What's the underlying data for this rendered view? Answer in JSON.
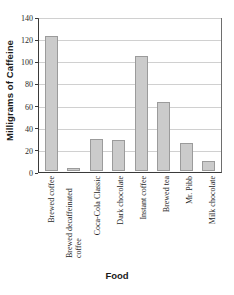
{
  "chart_data": {
    "type": "bar",
    "title": "",
    "xlabel": "Food",
    "ylabel": "Milligrams of Caffeine",
    "ylim": [
      0,
      140
    ],
    "ytick_step": 20,
    "yticks": [
      0,
      20,
      40,
      60,
      80,
      100,
      120,
      140
    ],
    "ytick_labels": [
      "0",
      "20",
      "40",
      "60",
      "80",
      "100",
      "120",
      "140"
    ],
    "grid": true,
    "legend": "none",
    "categories": [
      "Brewed coffee",
      "Brewed decaffeinated coffee",
      "Coca-Cola Classic",
      "Dark chocolate",
      "Instant coffee",
      "Brewed tea",
      "Mr. Pibb",
      "Milk chocolate"
    ],
    "values": [
      124,
      3,
      29,
      28,
      105,
      63,
      26,
      9
    ],
    "bar_color": "#cbcbcb",
    "bar_edge_color": "#9b9b9b",
    "grid_color": "#d0d0d0",
    "axis_color": "#3a3a3a"
  }
}
